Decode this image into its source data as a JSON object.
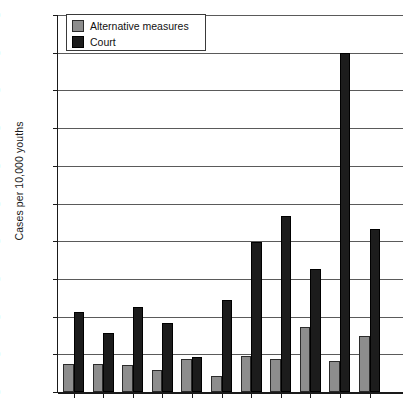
{
  "chart_data": {
    "type": "bar",
    "title": "",
    "xlabel": "",
    "ylabel": "Cases per 10,000 youths",
    "ylim": [
      0,
      2000
    ],
    "ytick_step": 200,
    "ytick_labels": [
      "2,000",
      "1,800",
      "1,600",
      "1,400",
      "1,200",
      "1,000",
      "800",
      "600",
      "400",
      "200",
      "0"
    ],
    "ytick_values": [
      2000,
      1800,
      1600,
      1400,
      1200,
      1000,
      800,
      600,
      400,
      200,
      0
    ],
    "grid": true,
    "legend_position": "top-left",
    "categories": [
      "NF",
      "PE",
      "NS",
      "NB",
      "QC",
      "ON",
      "MN",
      "SK",
      "AB",
      "YU",
      "NW"
    ],
    "series": [
      {
        "name": "Alternative measures",
        "color": "#8d8d8d",
        "values": [
          150,
          150,
          145,
          115,
          175,
          85,
          190,
          175,
          345,
          165,
          295
        ]
      },
      {
        "name": "Court",
        "color": "#1c1c1c",
        "values": [
          425,
          315,
          450,
          365,
          185,
          490,
          795,
          935,
          650,
          1800,
          865
        ]
      }
    ]
  },
  "legend": {
    "items": [
      {
        "label": "Alternative measures",
        "swatch": "alt"
      },
      {
        "label": "Court",
        "swatch": "court"
      }
    ]
  }
}
